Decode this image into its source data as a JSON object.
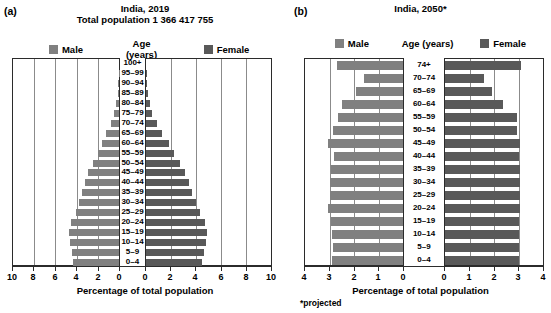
{
  "figure": {
    "background": "#ffffff",
    "male_color": "#808080",
    "female_color": "#595959",
    "axis_color": "#2b2b2b",
    "grid_color": "#8b8b8b"
  },
  "panels": [
    {
      "letter": "(a)",
      "title": "India, 2019",
      "subtitle": "Total population 1 366 417 755",
      "legend": {
        "male": "Male",
        "middle": "Age (years)",
        "female": "Female"
      },
      "axis_title": "Percentage of total population",
      "footnote": "",
      "left_ticks": [
        "10",
        "8",
        "6",
        "4",
        "2",
        "0"
      ],
      "right_ticks": [
        "0",
        "2",
        "4",
        "6",
        "8",
        "10"
      ],
      "max": 10
    },
    {
      "letter": "(b)",
      "title": "India, 2050*",
      "subtitle": "",
      "legend": {
        "male": "Male",
        "middle": "Age (years)",
        "female": "Female"
      },
      "axis_title": "Percentage of total population",
      "footnote": "*projected",
      "left_ticks": [
        "4",
        "3",
        "2",
        "1",
        "0"
      ],
      "right_ticks": [
        "0",
        "1",
        "2",
        "3",
        "4"
      ],
      "max": 4
    }
  ],
  "chart_data": [
    {
      "type": "bar",
      "subtype": "population-pyramid",
      "panel": "(a)",
      "title": "India, 2019",
      "subtitle": "Total population 1 366 417 755",
      "xlabel": "Percentage of total population",
      "ylabel": "Age (years)",
      "xlim": [
        -10,
        10
      ],
      "xticks_left": [
        10,
        8,
        6,
        4,
        2,
        0
      ],
      "xticks_right": [
        0,
        2,
        4,
        6,
        8,
        10
      ],
      "grid": true,
      "legend": [
        "Male",
        "Female"
      ],
      "legend_position": "top",
      "categories": [
        "100+",
        "95–99",
        "90–94",
        "85–89",
        "80–84",
        "75–79",
        "70–74",
        "65–69",
        "60–64",
        "55–59",
        "50–54",
        "45–49",
        "40–44",
        "35–39",
        "30–34",
        "25–29",
        "20–24",
        "15–19",
        "10–14",
        "5–9",
        "0–4"
      ],
      "series": [
        {
          "name": "Male",
          "side": "left",
          "values": [
            0.0,
            0.02,
            0.05,
            0.12,
            0.26,
            0.45,
            0.8,
            1.2,
            1.6,
            2.0,
            2.5,
            2.9,
            3.2,
            3.5,
            3.8,
            4.1,
            4.5,
            4.7,
            4.6,
            4.4,
            4.3
          ]
        },
        {
          "name": "Female",
          "side": "right",
          "values": [
            0.0,
            0.02,
            0.06,
            0.14,
            0.3,
            0.5,
            0.9,
            1.3,
            1.8,
            2.2,
            2.7,
            3.1,
            3.4,
            3.7,
            4.0,
            4.3,
            4.7,
            4.9,
            4.8,
            4.6,
            4.5
          ]
        }
      ]
    },
    {
      "type": "bar",
      "subtype": "population-pyramid",
      "panel": "(b)",
      "title": "India, 2050*",
      "subtitle": "",
      "xlabel": "Percentage of total population",
      "ylabel": "Age (years)",
      "footnote": "*projected",
      "xlim": [
        -4,
        4
      ],
      "xticks_left": [
        4,
        3,
        2,
        1,
        0
      ],
      "xticks_right": [
        0,
        1,
        2,
        3,
        4
      ],
      "grid": true,
      "legend": [
        "Male",
        "Female"
      ],
      "legend_position": "top",
      "categories": [
        "74+",
        "70–74",
        "65–69",
        "60–64",
        "55–59",
        "50–54",
        "45–49",
        "40–44",
        "35–39",
        "30–34",
        "25–29",
        "20–24",
        "15–19",
        "10–14",
        "5–9",
        "0–4"
      ],
      "series": [
        {
          "name": "Male",
          "side": "left",
          "values": [
            2.7,
            1.6,
            1.9,
            2.5,
            2.65,
            2.85,
            3.05,
            2.8,
            2.95,
            3.0,
            3.0,
            3.05,
            2.95,
            2.9,
            2.85,
            2.9
          ]
        },
        {
          "name": "Female",
          "side": "right",
          "values": [
            3.1,
            1.6,
            1.9,
            2.35,
            2.95,
            2.95,
            3.05,
            3.0,
            3.05,
            3.05,
            3.05,
            3.05,
            3.0,
            3.0,
            3.0,
            3.0
          ]
        }
      ]
    }
  ]
}
